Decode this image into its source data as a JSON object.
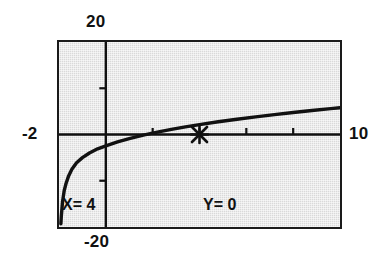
{
  "screen": {
    "kind": "graphing-calculator-plot",
    "background_color": "#ffffff",
    "plot_background_color": "#d9d9d9",
    "ink_color": "#111111"
  },
  "labels": {
    "y_max": "20",
    "y_min": "-20",
    "x_min": "-2",
    "x_max": "10"
  },
  "trace": {
    "x_readout": "X= 4",
    "y_readout": "Y= 0",
    "cursor_glyph": "x-cursor"
  },
  "chart_data": {
    "type": "line",
    "title": "",
    "xlabel": "",
    "ylabel": "",
    "xlim": [
      -2,
      10
    ],
    "ylim": [
      -20,
      20
    ],
    "grid": false,
    "legend": null,
    "x_ticks": [
      0,
      2,
      4,
      6,
      8
    ],
    "y_ticks": [
      -10,
      0,
      10
    ],
    "axes": {
      "x_axis_at_y": 0,
      "y_axis_at_x": 0
    },
    "series": [
      {
        "name": "curve",
        "x": [
          -1.92,
          -1.9,
          -1.85,
          -1.78,
          -1.7,
          -1.6,
          -1.45,
          -1.25,
          -1.0,
          -0.7,
          -0.35,
          0.0,
          0.5,
          1.0,
          1.6,
          2.2,
          2.8,
          3.4,
          4.0,
          4.8,
          5.6,
          6.4,
          7.2,
          8.0,
          8.8,
          9.6,
          10.0
        ],
        "y": [
          -19.3,
          -17.6,
          -14.6,
          -12.2,
          -10.6,
          -9.1,
          -7.5,
          -6.1,
          -5.0,
          -4.0,
          -3.1,
          -2.45,
          -1.6,
          -0.9,
          -0.15,
          0.5,
          1.1,
          1.65,
          2.15,
          2.75,
          3.3,
          3.8,
          4.3,
          4.75,
          5.2,
          5.6,
          5.8
        ]
      }
    ],
    "annotations": [
      {
        "name": "trace-cursor",
        "x": 4.0,
        "y": 0.0,
        "marker": "x"
      }
    ]
  }
}
